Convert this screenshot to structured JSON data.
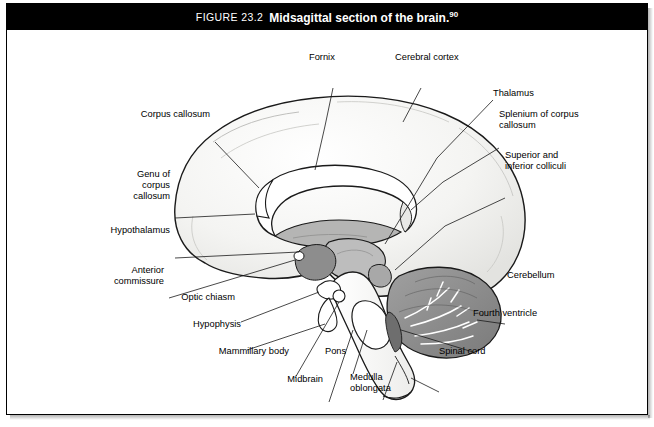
{
  "figure": {
    "number": "FIGURE 23.2",
    "title": "Midsagittal section of the brain.",
    "superscript": "90"
  },
  "labels": {
    "fornix": "Fornix",
    "cerebral_cortex": "Cerebral cortex",
    "thalamus": "Thalamus",
    "corpus_callosum": "Corpus callosum",
    "splenium_line1": "Splenium of corpus",
    "splenium_line2": "callosum",
    "colliculi_line1": "Superior and",
    "colliculi_line2": "inferior colliculi",
    "genu_line1": "Genu of",
    "genu_line2": "corpus",
    "genu_line3": "callosum",
    "hypothalamus": "Hypothalamus",
    "anterior_commissure_line1": "Anterior",
    "anterior_commissure_line2": "commissure",
    "optic_chiasm": "Optic chiasm",
    "hypophysis": "Hypophysis",
    "mammillary_body": "Mammillary body",
    "midbrain": "Midbrain",
    "pons": "Pons",
    "medulla_line1": "Medulla",
    "medulla_line2": "oblongata",
    "spinal_cord": "Spinal cord",
    "fourth_ventricle": "Fourth ventricle",
    "cerebellum": "Cerebellum"
  },
  "colors": {
    "header_bg": "#000000",
    "header_text": "#ffffff",
    "outline": "#1a1a1a",
    "cortex_fill": "#f2f2f0",
    "cortex_inner": "#d9d9d6",
    "midgray": "#9a9a99",
    "darkgray": "#6e6e6e",
    "brainstem_fill": "#ffffff",
    "cerebellum_fill": "#8c8c8c",
    "thalamus_fill": "#bdbdbd"
  }
}
